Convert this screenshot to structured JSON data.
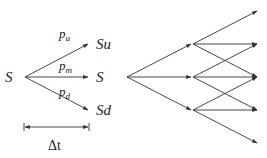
{
  "left_tree": {
    "root_label": "S",
    "branches": [
      {
        "id": "up",
        "prob_base": "p",
        "prob_sub": "u",
        "target_label": "Su"
      },
      {
        "id": "mid",
        "prob_base": "p",
        "prob_sub": "m",
        "target_label": "S"
      },
      {
        "id": "down",
        "prob_base": "p",
        "prob_sub": "d",
        "target_label": "Sd"
      }
    ],
    "interval_label": "Δt"
  },
  "right_tree": {
    "levels": 2,
    "branching": 3,
    "description": "two-step trinomial tree"
  },
  "colors": {
    "line": "#333333",
    "text": "#222222",
    "background": "#ffffff"
  }
}
